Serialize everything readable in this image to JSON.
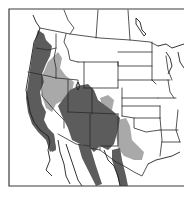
{
  "map": {
    "type": "species-range-map",
    "region": "Western North America (USA and northern Mexico)",
    "background_color": "#ffffff",
    "frame_color": "#3a3a3a",
    "boundary_color": "#2a2a2a",
    "legend": [],
    "ranges": [
      {
        "id": "primary",
        "label": "",
        "color": "#5c5c5c"
      },
      {
        "id": "secondary",
        "label": "",
        "color": "#a9a9a9"
      }
    ],
    "text_labels": []
  }
}
